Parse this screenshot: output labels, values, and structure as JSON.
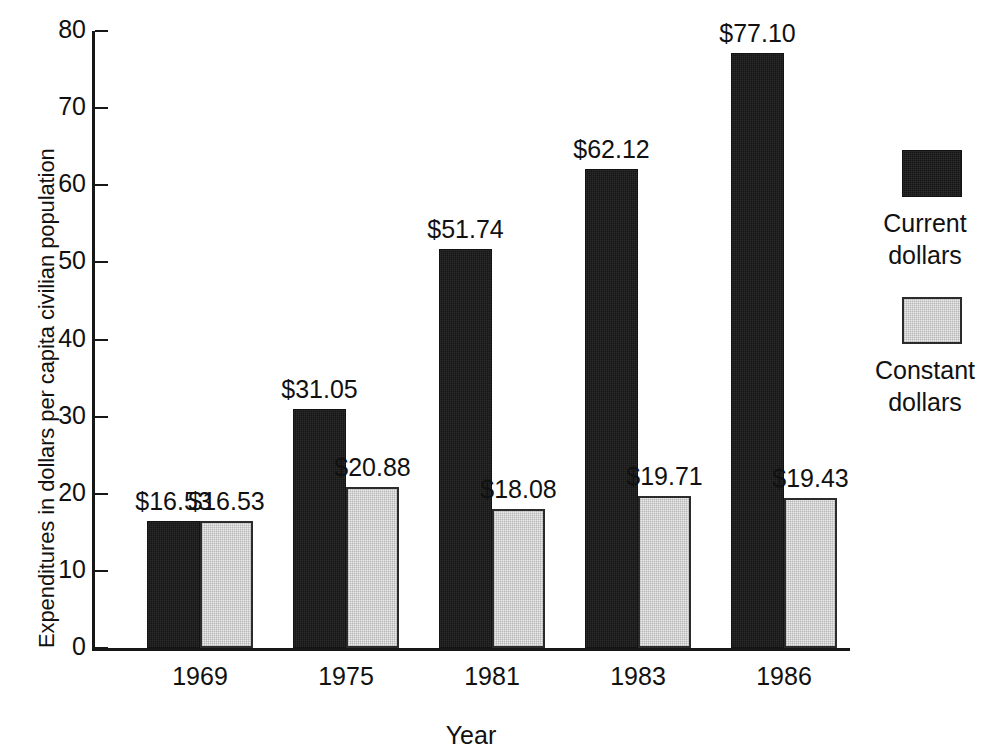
{
  "chart_data": {
    "type": "bar",
    "title": "",
    "xlabel": "Year",
    "ylabel": "Expenditures in dollars per capita civilian population",
    "categories": [
      "1969",
      "1975",
      "1981",
      "1983",
      "1986"
    ],
    "ylim": [
      0,
      80
    ],
    "yticks": [
      0,
      10,
      20,
      30,
      40,
      50,
      60,
      70,
      80
    ],
    "ytick_labels": [
      "0",
      "10",
      "20",
      "30",
      "40",
      "50",
      "60",
      "70",
      "80"
    ],
    "grid": false,
    "legend_position": "right",
    "series": [
      {
        "name": "Current dollars",
        "color": "#151515",
        "values": [
          16.53,
          31.05,
          51.74,
          62.12,
          77.1
        ],
        "labels": [
          "$16.53",
          "$31.05",
          "$51.74",
          "$62.12",
          "$77.10"
        ]
      },
      {
        "name": "Constant dollars",
        "color": "#ececec",
        "values": [
          16.53,
          20.88,
          18.08,
          19.71,
          19.43
        ],
        "labels": [
          "$16.53",
          "$20.88",
          "$18.08",
          "$19.71",
          "$19.43"
        ]
      }
    ]
  },
  "legend": {
    "entries": [
      {
        "line1": "Current",
        "line2": "dollars"
      },
      {
        "line1": "Constant",
        "line2": "dollars"
      }
    ]
  }
}
